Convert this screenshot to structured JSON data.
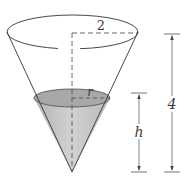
{
  "figure": {
    "labels": {
      "top_radius": "2",
      "water_radius": "r",
      "water_height": "h",
      "total_height": "4"
    },
    "colors": {
      "stroke": "#333333",
      "water_fill": "#bdbdbd",
      "water_top": "#a9a9a9",
      "dash": "#555555"
    }
  }
}
